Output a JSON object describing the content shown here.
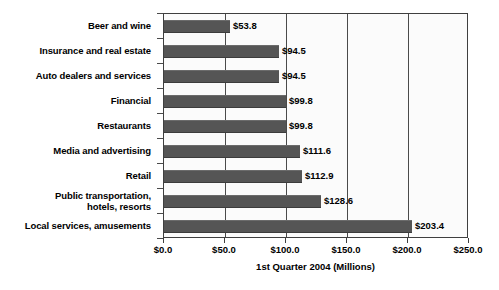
{
  "chart_data": {
    "type": "bar",
    "orientation": "horizontal",
    "title": "",
    "xlabel": "1st Quarter 2004 (Millions)",
    "ylabel": "",
    "xlim": [
      0,
      250
    ],
    "xticks": [
      0,
      50,
      100,
      150,
      200,
      250
    ],
    "xtick_labels": [
      "$0.0",
      "$50.0",
      "$100.0",
      "$150.0",
      "$200.0",
      "$250.0"
    ],
    "grid": true,
    "grid_axis": "x",
    "legend": false,
    "bar_color": "#555555",
    "plot_background": "#fbfbfb",
    "categories": [
      "Beer and wine",
      "Insurance and real estate",
      "Auto dealers and services",
      "Financial",
      "Restaurants",
      "Media and advertising",
      "Retail",
      "Public transportation,\nhotels, resorts",
      "Local services, amusements"
    ],
    "values": [
      53.8,
      94.5,
      94.5,
      99.8,
      99.8,
      111.6,
      112.9,
      128.6,
      203.4
    ],
    "data_labels": [
      "$53.8",
      "$94.5",
      "$94.5",
      "$99.8",
      "$99.8",
      "$111.6",
      "$112.9",
      "$128.6",
      "$203.4"
    ]
  }
}
